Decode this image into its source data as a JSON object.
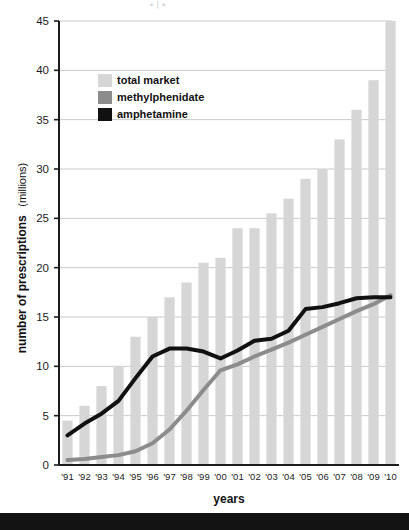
{
  "page": {
    "background": "#ffffff",
    "bottom_band_color": "#131313",
    "top_artifact_text": "• |                        •"
  },
  "chart_data": {
    "type": "bar",
    "title": "",
    "subtitle": "",
    "xlabel": "years",
    "ylabel": "number of prescriptions",
    "ylabel_unit": "(millions)",
    "ylim": [
      0,
      45
    ],
    "yticks": [
      0,
      5,
      10,
      15,
      20,
      25,
      30,
      35,
      40,
      45
    ],
    "ytick_labels": [
      "0",
      "5",
      "10",
      "15",
      "20",
      "25",
      "30",
      "35",
      "40",
      "45"
    ],
    "grid": "horizontal",
    "legend_position": "top-left-inside",
    "categories": [
      "'91",
      "'92",
      "'93",
      "'94",
      "'95",
      "'96",
      "'97",
      "'98",
      "'99",
      "'00",
      "'01",
      "'02",
      "'03",
      "'04",
      "'05",
      "'06",
      "'07",
      "'08",
      "'09",
      "'10"
    ],
    "series": [
      {
        "name": "total market",
        "type": "bar",
        "color": "#d6d6d6",
        "values": [
          4.5,
          6.0,
          8.0,
          10.0,
          13.0,
          15.0,
          17.0,
          18.5,
          20.5,
          21.0,
          24.0,
          24.0,
          25.5,
          27.0,
          29.0,
          30.0,
          33.0,
          36.0,
          39.0,
          45.0
        ]
      },
      {
        "name": "methylphenidate",
        "type": "line",
        "color": "#8c8c8c",
        "values": [
          0.5,
          0.6,
          0.8,
          1.0,
          1.4,
          2.2,
          3.6,
          5.5,
          7.6,
          9.6,
          10.2,
          11.0,
          11.7,
          12.4,
          13.2,
          14.0,
          14.8,
          15.6,
          16.3,
          17.2
        ]
      },
      {
        "name": "amphetamine",
        "type": "line",
        "color": "#111111",
        "values": [
          3.0,
          4.2,
          5.2,
          6.5,
          8.8,
          11.0,
          11.8,
          11.8,
          11.5,
          10.8,
          11.6,
          12.6,
          12.8,
          13.6,
          15.8,
          16.0,
          16.4,
          16.9,
          17.0,
          17.0
        ]
      }
    ],
    "legend_entries": [
      {
        "label": "total market",
        "color": "#d6d6d6"
      },
      {
        "label": "methylphenidate",
        "color": "#8c8c8c"
      },
      {
        "label": "amphetamine",
        "color": "#111111"
      }
    ]
  }
}
